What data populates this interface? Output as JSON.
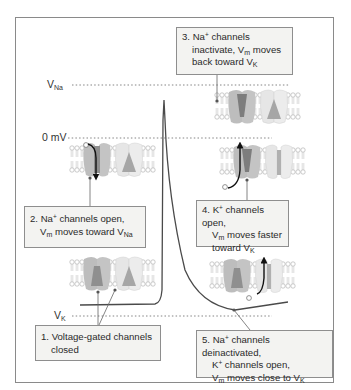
{
  "diagram": {
    "levels": {
      "v_na": {
        "label": "V",
        "sub": "Na"
      },
      "zero": {
        "label": "0 mV"
      },
      "v_k": {
        "label": "V",
        "sub": "K"
      }
    },
    "callouts": [
      {
        "id": 1,
        "lines": [
          "1. Voltage-gated channels",
          "closed"
        ]
      },
      {
        "id": 2,
        "lines": [
          "2. Na",
          "+",
          " channels open,",
          "V",
          "m",
          " moves toward V",
          "Na"
        ]
      },
      {
        "id": 3,
        "lines": [
          "3. Na",
          "+",
          " channels",
          "inactivate, V",
          "m",
          " moves",
          "back toward V",
          "K"
        ]
      },
      {
        "id": 4,
        "lines": [
          "4. K",
          "+",
          " channels open,",
          "V",
          "m",
          " moves faster",
          "toward V",
          "K"
        ]
      },
      {
        "id": 5,
        "lines": [
          "5. Na",
          "+",
          " channels deinactivated,",
          "K",
          "+",
          " channels open,",
          "V",
          "m",
          " moves close to V",
          "K"
        ]
      }
    ],
    "colors": {
      "frame": "#8a8a8a",
      "trace": "#4a4a4a",
      "callout_bg": "#f3f3f1",
      "na_channel": "#b9b9b9",
      "na_channel_dark": "#8c8c8c",
      "k_channel": "#e4e4e4",
      "k_channel_dark": "#a8a8a8",
      "lipid": "#cfcfcf",
      "arrow": "#111111"
    }
  }
}
